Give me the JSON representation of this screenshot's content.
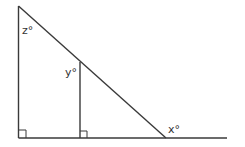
{
  "diagram": {
    "type": "geometry-triangle",
    "labels": {
      "top_angle": "z°",
      "inner_angle": "y°",
      "exterior_angle": "x°"
    },
    "right_angle_markers": 2,
    "colors": {
      "line": "#3a3a3a",
      "text": "#333333",
      "background": "#ffffff"
    }
  }
}
